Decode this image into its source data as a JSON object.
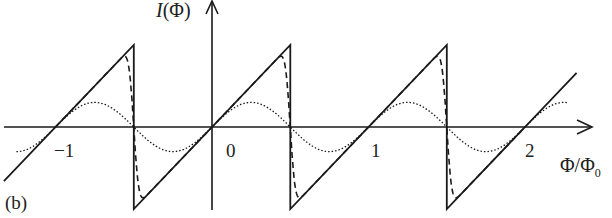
{
  "chart_data": {
    "type": "line",
    "title": "",
    "panel_label": "(b)",
    "xlabel": "Φ/Φ0",
    "xlabel_main": "Φ/Φ",
    "xlabel_sub": "0",
    "ylabel": "I(Φ)",
    "ylabel_i": "I",
    "ylabel_rest": "(Φ)",
    "x_ticks": [
      "−1",
      "0",
      "1",
      "2"
    ],
    "x_tick_values": [
      -1,
      0,
      1,
      2
    ],
    "xlim": [
      -1.33,
      2.33
    ],
    "ylim": [
      -1.05,
      1.05
    ],
    "grid": false,
    "legend": null,
    "series": [
      {
        "name": "sawtooth (solid)",
        "style": "solid",
        "description": "I ∝ (Φ/Φ0 − n), linear rise with jump at half-integer flux",
        "x": [
          -1.33,
          -0.5,
          -0.5,
          0.5,
          0.5,
          1.5,
          1.5,
          2.33
        ],
        "y": [
          -0.66,
          1.0,
          -1.0,
          1.0,
          -1.0,
          1.0,
          -1.0,
          0.66
        ]
      },
      {
        "name": "rounded sawtooth (dashed)",
        "style": "dashed",
        "description": "smoothed sawtooth peaking ~0.78 near Φ/Φ0 = ±0.4"
      },
      {
        "name": "sinusoid (dotted)",
        "style": "dotted",
        "description": "I ∝ sin(2πΦ/Φ0), amplitude ~0.3",
        "amplitude": 0.3
      }
    ]
  },
  "colors": {
    "line": "#1a1a1a",
    "axis": "#1a1a1a",
    "background": "#ffffff"
  }
}
